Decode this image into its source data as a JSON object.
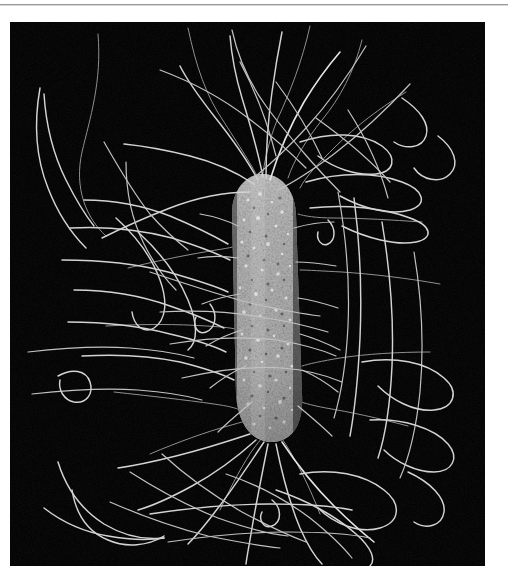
{
  "page": {
    "background_color": "#ffffff",
    "width": 508,
    "height": 584
  },
  "top_rule": {
    "color": "#9a9a9a",
    "name": "horizontal-rule"
  },
  "figure": {
    "caption": "",
    "plate_background_color": "#000000",
    "plate_left": 10,
    "plate_top": 22,
    "plate_width": 475,
    "plate_height": 544,
    "image_type": "scanning-electron-micrograph",
    "filament_color": "#d9d9d9",
    "cell_body_color": "#9a9a9a"
  },
  "micrograph": {
    "cell_body": {
      "name": "bacterium-cell-body",
      "orientation": "vertical",
      "center_x": 254,
      "top_y": 162,
      "bottom_y": 441,
      "width": 60,
      "tilt_degrees": -4,
      "surface_texture": "granular",
      "highlight_color": "#e8e8e8",
      "midtone_color": "#8d8d8d",
      "shadow_color": "#2a2a2a"
    },
    "flagella": {
      "name": "flagella-filaments",
      "count": 46,
      "stroke_width": 1.4,
      "color": "#d9d9d9",
      "arrangement": "peritrichous"
    }
  }
}
